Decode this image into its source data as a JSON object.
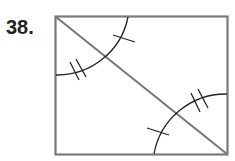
{
  "problem": {
    "number": "38.",
    "figure": {
      "shape": "rectangle with diagonal",
      "stroke_color": "#7a7a7a",
      "mark_color": "#222222",
      "angles": [
        {
          "vertex": "top-left",
          "region": "upper (between top side and diagonal)",
          "marks": 1
        },
        {
          "vertex": "top-left",
          "region": "lower (between left side and diagonal)",
          "marks": 2
        },
        {
          "vertex": "bottom-right",
          "region": "upper (between right side and diagonal)",
          "marks": 2
        },
        {
          "vertex": "bottom-right",
          "region": "lower (between bottom side and diagonal)",
          "marks": 1
        }
      ]
    }
  }
}
